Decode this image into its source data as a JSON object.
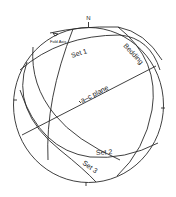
{
  "diagram": {
    "type": "stereonet",
    "north_label": "N",
    "labels": {
      "fold_axis": "Fold Axis",
      "set1": "Set 1",
      "bedding": "Bedding",
      "ac_plane": "a–c plane",
      "set2": "Set 2",
      "set3": "Set 3"
    },
    "colors": {
      "line": "#2a2a2a",
      "background": "#ffffff"
    }
  }
}
